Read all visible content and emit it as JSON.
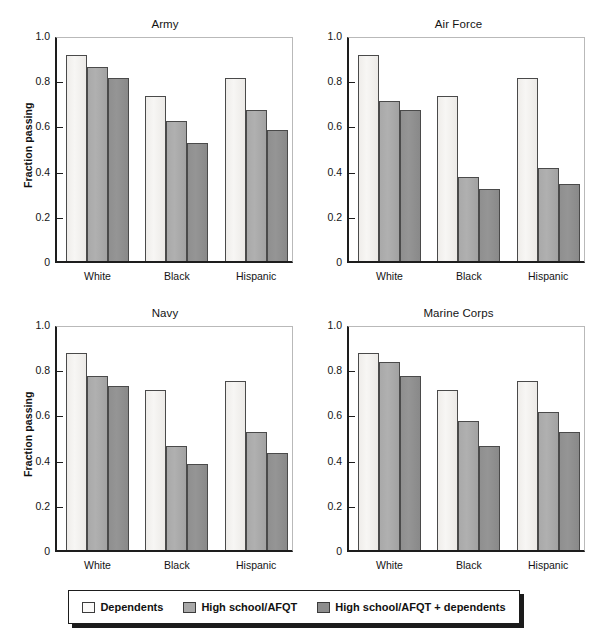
{
  "figure": {
    "ylabel": "Fraction passing",
    "ytick_labels": [
      "1.0",
      "0.8",
      "0.6",
      "0.4",
      "0.2",
      "0"
    ],
    "xtick_labels": [
      "White",
      "Black",
      "Hispanic"
    ],
    "panel_titles": [
      "Army",
      "Air Force",
      "Navy",
      "Marine Corps"
    ],
    "colors": {
      "series_0": "#f7f6f4",
      "series_1": "#a8a8a8",
      "series_2": "#8d8d8d",
      "axis": "#1d1d1d",
      "bar_edge": "#4a4a4a",
      "text": "#141414"
    }
  },
  "legend": {
    "items": [
      {
        "label": "Dependents",
        "swatch": "series_0"
      },
      {
        "label": "High school/AFQT",
        "swatch": "series_1"
      },
      {
        "label": "High school/AFQT + dependents",
        "swatch": "series_2"
      }
    ]
  },
  "chart_data": [
    {
      "type": "bar",
      "title": "Army",
      "xlabel": "",
      "ylabel": "Fraction passing",
      "categories": [
        "White",
        "Black",
        "Hispanic"
      ],
      "ylim": [
        0,
        1.0
      ],
      "yticks": [
        0,
        0.2,
        0.4,
        0.6,
        0.8,
        1.0
      ],
      "grid": false,
      "legend_position": "bottom",
      "series": [
        {
          "name": "Dependents",
          "values": [
            0.91,
            0.73,
            0.81
          ]
        },
        {
          "name": "High school/AFQT",
          "values": [
            0.86,
            0.62,
            0.67
          ]
        },
        {
          "name": "High school/AFQT + dependents",
          "values": [
            0.81,
            0.52,
            0.58
          ]
        }
      ]
    },
    {
      "type": "bar",
      "title": "Air Force",
      "xlabel": "",
      "ylabel": "Fraction passing",
      "categories": [
        "White",
        "Black",
        "Hispanic"
      ],
      "ylim": [
        0,
        1.0
      ],
      "yticks": [
        0,
        0.2,
        0.4,
        0.6,
        0.8,
        1.0
      ],
      "grid": false,
      "legend_position": "bottom",
      "series": [
        {
          "name": "Dependents",
          "values": [
            0.91,
            0.73,
            0.81
          ]
        },
        {
          "name": "High school/AFQT",
          "values": [
            0.71,
            0.37,
            0.41
          ]
        },
        {
          "name": "High school/AFQT + dependents",
          "values": [
            0.67,
            0.32,
            0.34
          ]
        }
      ]
    },
    {
      "type": "bar",
      "title": "Navy",
      "xlabel": "",
      "ylabel": "Fraction passing",
      "categories": [
        "White",
        "Black",
        "Hispanic"
      ],
      "ylim": [
        0,
        1.0
      ],
      "yticks": [
        0,
        0.2,
        0.4,
        0.6,
        0.8,
        1.0
      ],
      "grid": false,
      "legend_position": "bottom",
      "series": [
        {
          "name": "Dependents",
          "values": [
            0.87,
            0.71,
            0.75
          ]
        },
        {
          "name": "High school/AFQT",
          "values": [
            0.77,
            0.46,
            0.52
          ]
        },
        {
          "name": "High school/AFQT + dependents",
          "values": [
            0.725,
            0.38,
            0.43
          ]
        }
      ]
    },
    {
      "type": "bar",
      "title": "Marine Corps",
      "xlabel": "",
      "ylabel": "Fraction passing",
      "categories": [
        "White",
        "Black",
        "Hispanic"
      ],
      "ylim": [
        0,
        1.0
      ],
      "yticks": [
        0,
        0.2,
        0.4,
        0.6,
        0.8,
        1.0
      ],
      "grid": false,
      "legend_position": "bottom",
      "series": [
        {
          "name": "Dependents",
          "values": [
            0.87,
            0.71,
            0.75
          ]
        },
        {
          "name": "High school/AFQT",
          "values": [
            0.83,
            0.57,
            0.61
          ]
        },
        {
          "name": "High school/AFQT + dependents",
          "values": [
            0.77,
            0.46,
            0.52
          ]
        }
      ]
    }
  ]
}
